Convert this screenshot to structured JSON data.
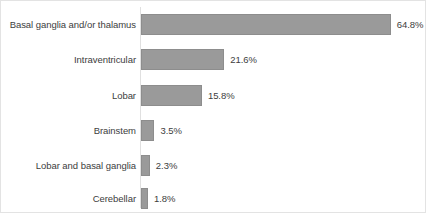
{
  "chart_data": {
    "type": "bar",
    "orientation": "horizontal",
    "title": "",
    "xlabel": "",
    "ylabel": "",
    "grid": false,
    "legend": false,
    "xlim": [
      0,
      70
    ],
    "value_suffix": "%",
    "categories": [
      "Basal ganglia and/or thalamus",
      "Intraventricular",
      "Lobar",
      "Brainstem",
      "Lobar and basal ganglia",
      "Cerebellar"
    ],
    "values": [
      64.8,
      21.6,
      15.8,
      3.5,
      2.3,
      1.8
    ],
    "value_labels": [
      "64.8%",
      "21.6%",
      "15.8%",
      "3.5%",
      "2.3%",
      "1.8%"
    ],
    "colors": {
      "bar_fill": "#9a9a9a",
      "bar_border": "#8d8d8d",
      "text": "#3d3d3d",
      "axis": "#e0e0e0",
      "plot_background": "#ffffff",
      "container_border": "#e3e3e3"
    }
  }
}
